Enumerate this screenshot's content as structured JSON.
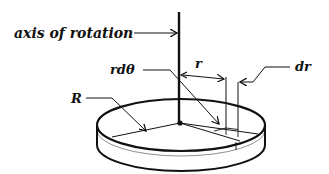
{
  "diagram": {
    "labels": {
      "axis": "axis of rotation",
      "rdtheta": "rdθ",
      "r": "r",
      "dr": "dr",
      "R": "R"
    },
    "colors": {
      "line": "#111111",
      "background": "#ffffff"
    }
  }
}
